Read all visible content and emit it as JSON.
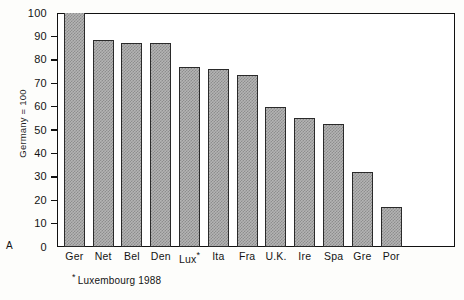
{
  "panel": {
    "letter": "A"
  },
  "chart_data": {
    "type": "bar",
    "title": "",
    "subtitle": "",
    "xlabel": "",
    "ylabel": "Germany = 100",
    "ylim": [
      0,
      100
    ],
    "ytick_step": 10,
    "yticks": [
      0,
      10,
      20,
      30,
      40,
      50,
      60,
      70,
      80,
      90,
      100
    ],
    "ytick_labels": [
      "0",
      "10",
      "20",
      "30",
      "40",
      "50",
      "60",
      "70",
      "80",
      "90",
      "100"
    ],
    "grid": false,
    "legend": null,
    "legend_position": "none",
    "categories": [
      "Ger",
      "Net",
      "Bel",
      "Den",
      "Lux*",
      "Ita",
      "Fra",
      "U.K.",
      "Ire",
      "Spa",
      "Gre",
      "Por"
    ],
    "values": [
      100,
      88.5,
      87,
      87,
      77,
      76,
      73.5,
      60,
      55,
      52.5,
      32,
      17
    ],
    "annotations": [
      "* Luxembourg 1988"
    ],
    "bar_fill": "#b4b4b4",
    "bar_pattern": "checkerboard-dither",
    "bar_edge_color": "#2a2a2a"
  },
  "footnote": {
    "star": "*",
    "text": "Luxembourg 1988"
  },
  "colors": {
    "bar_fill": "#b4b4b4",
    "bar_pattern": "#8d8d8d",
    "bar_edge": "#2a2a2a",
    "axis": "#111111",
    "text": "#141414",
    "background": "#fdfdfb"
  }
}
